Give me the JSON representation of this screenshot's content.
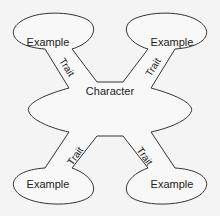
{
  "diagram": {
    "center": {
      "label": "Character"
    },
    "nodes": [
      {
        "id": "top-left",
        "label": "Example",
        "edge_label": "Trait"
      },
      {
        "id": "top-right",
        "label": "Example",
        "edge_label": "Trait"
      },
      {
        "id": "bottom-left",
        "label": "Example",
        "edge_label": "Trait"
      },
      {
        "id": "bottom-right",
        "label": "Example",
        "edge_label": "Trait"
      }
    ],
    "colors": {
      "stroke": "#333333",
      "background": "#f4f4f4",
      "text": "#222222"
    }
  }
}
